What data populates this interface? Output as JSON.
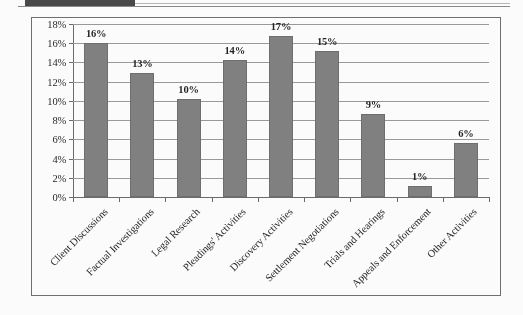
{
  "artifacts": {
    "redaction_label": "redaction-block",
    "rule_label": "horizontal-rule"
  },
  "chart_data": {
    "type": "bar",
    "title": "",
    "subtitle": "",
    "xlabel": "",
    "ylabel": "",
    "categories": [
      "Client Discussions",
      "Factual Investigations",
      "Legal Research",
      "Pleadings' Activities",
      "Discovery Activities",
      "Settlement Negotiations",
      "Trials and Hearings",
      "Appeals and Enforcement",
      "Other Activities"
    ],
    "values": [
      16,
      13,
      10,
      14,
      17,
      15,
      9,
      1,
      6
    ],
    "value_labels": [
      "16%",
      "13%",
      "10%",
      "14%",
      "17%",
      "15%",
      "9%",
      "1%",
      "6%"
    ],
    "bar_render_values": [
      16.0,
      12.9,
      10.2,
      14.3,
      16.8,
      15.2,
      8.6,
      1.1,
      5.6
    ],
    "ylim": [
      0,
      18
    ],
    "ytick_step": 2,
    "ytick_values": [
      0,
      2,
      4,
      6,
      8,
      10,
      12,
      14,
      16,
      18
    ],
    "ytick_labels": [
      "0%",
      "2%",
      "4%",
      "6%",
      "8%",
      "10%",
      "12%",
      "14%",
      "16%",
      "18%"
    ],
    "grid": true,
    "grid_axis": "y",
    "legend": false,
    "legend_position": "none",
    "series_color": "#808080",
    "gridline_color": "#9a9a9a",
    "axis_color": "#6a6a6a",
    "plot_background": "#ffffff"
  }
}
